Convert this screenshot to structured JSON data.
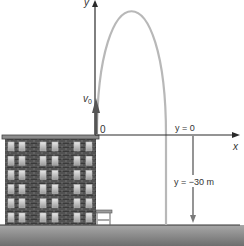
{
  "diagram": {
    "axis_y_label": "y",
    "axis_x_label": "x",
    "velocity_label": "v",
    "velocity_subscript": "0",
    "origin_label": "0",
    "ref_line_label": "y = 0",
    "depth_label": "y = −30 m",
    "colors": {
      "axis": "#2a2a2a",
      "trajectory": "#b8b8b8",
      "brick": "#3a3a3a",
      "window": "#cfcfcf",
      "ground_top": "#a8a8a8",
      "ground_bottom": "#6a6a6a",
      "arrow": "#7a7a7a"
    }
  }
}
